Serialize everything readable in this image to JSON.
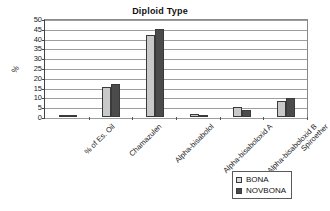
{
  "chart_data": {
    "type": "bar",
    "title": "Diploid Type",
    "xlabel": "",
    "ylabel": "%",
    "ylim": [
      0,
      50
    ],
    "yticks": [
      0,
      5,
      10,
      15,
      20,
      25,
      30,
      35,
      40,
      45,
      50
    ],
    "grid": true,
    "legend_position": "bottom-right",
    "categories": [
      "% of Es. Oil",
      "Chamazulen",
      "Alpha-bisabolol",
      "Alpha-bisaboloxid A",
      "Alpha-bisaboloxid B",
      "Spiroether"
    ],
    "series": [
      {
        "name": "BONA",
        "color": "#c9c9c9",
        "values": [
          1.0,
          15.7,
          42.6,
          1.6,
          5.1,
          8.6
        ]
      },
      {
        "name": "NOVBONA",
        "color": "#4b4b4b",
        "values": [
          1.0,
          17.4,
          45.7,
          1.0,
          3.8,
          10.0
        ]
      }
    ]
  },
  "legend": {
    "items": [
      {
        "label": "BONA",
        "swatch": "bona"
      },
      {
        "label": "NOVBONA",
        "swatch": "novbona"
      }
    ]
  }
}
